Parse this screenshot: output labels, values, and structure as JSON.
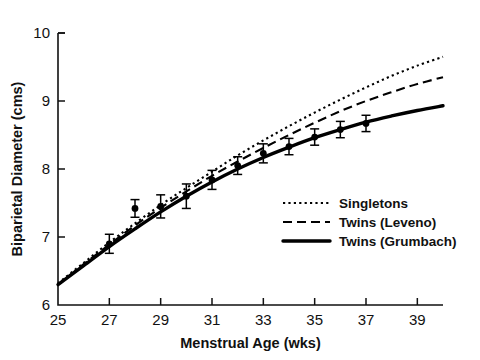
{
  "chart_data": {
    "type": "line",
    "title": "",
    "xlabel": "Menstrual Age (wks)",
    "ylabel": "Biparietal Diameter (cms)",
    "xlim": [
      25,
      40
    ],
    "ylim": [
      6,
      10
    ],
    "xticks": [
      25,
      27,
      29,
      31,
      33,
      35,
      37,
      39
    ],
    "xtick_labels": [
      "25",
      "27",
      "29",
      "31",
      "33",
      "35",
      "37",
      "39"
    ],
    "yticks": [
      6,
      7,
      8,
      9,
      10
    ],
    "ytick_labels": [
      "6",
      "7",
      "8",
      "9",
      "10"
    ],
    "grid": false,
    "legend_position": "lower right",
    "series": [
      {
        "name": "Singletons",
        "style": "dotted",
        "x": [
          25,
          26,
          27,
          28,
          29,
          30,
          31,
          32,
          33,
          34,
          35,
          36,
          37,
          38,
          39,
          40
        ],
        "y": [
          6.32,
          6.62,
          6.92,
          7.2,
          7.47,
          7.72,
          7.96,
          8.2,
          8.42,
          8.63,
          8.83,
          9.02,
          9.2,
          9.37,
          9.52,
          9.65
        ]
      },
      {
        "name": "Twins (Leveno)",
        "style": "dashed",
        "x": [
          25,
          26,
          27,
          28,
          29,
          30,
          31,
          32,
          33,
          34,
          35,
          36,
          37,
          38,
          39,
          40
        ],
        "y": [
          6.3,
          6.6,
          6.89,
          7.17,
          7.43,
          7.67,
          7.9,
          8.11,
          8.31,
          8.5,
          8.68,
          8.85,
          9.0,
          9.13,
          9.25,
          9.35
        ]
      },
      {
        "name": "Twins (Grumbach)",
        "style": "solid",
        "x": [
          25,
          26,
          27,
          28,
          29,
          30,
          31,
          32,
          33,
          34,
          35,
          36,
          37,
          38,
          39,
          40
        ],
        "y": [
          6.3,
          6.58,
          6.86,
          7.12,
          7.37,
          7.6,
          7.81,
          8.0,
          8.17,
          8.32,
          8.46,
          8.58,
          8.69,
          8.78,
          8.86,
          8.93
        ]
      }
    ],
    "data_points": {
      "name": "Observed twin measurements (mean ± SD)",
      "marker": "filled-circle-with-error-bars",
      "x": [
        27.0,
        28.0,
        29.0,
        30.0,
        31.0,
        32.0,
        33.0,
        34.0,
        35.0,
        36.0,
        37.0
      ],
      "y": [
        6.9,
        7.42,
        7.45,
        7.6,
        7.84,
        8.05,
        8.23,
        8.33,
        8.47,
        8.58,
        8.67
      ],
      "yerr": [
        0.14,
        0.13,
        0.17,
        0.18,
        0.14,
        0.13,
        0.14,
        0.12,
        0.12,
        0.12,
        0.12
      ]
    }
  },
  "legend": {
    "items": [
      {
        "label": "Singletons",
        "style": "dotted"
      },
      {
        "label": "Twins (Leveno)",
        "style": "dashed"
      },
      {
        "label": "Twins (Grumbach)",
        "style": "solid"
      }
    ]
  },
  "colors": {
    "ink": "#111111",
    "background": "#ffffff"
  }
}
